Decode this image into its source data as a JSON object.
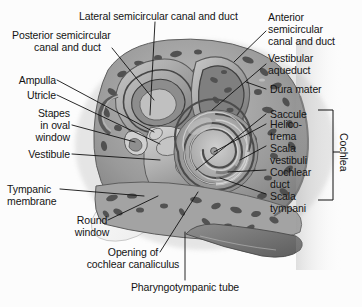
{
  "figure": {
    "style": "grayscale medical illustration",
    "background_color": "#fcfcfc",
    "text_color": "#141414",
    "leader_line_color": "#111111"
  },
  "labels": {
    "lateral_canal": "Lateral semicircular canal and duct",
    "posterior_canal_l1": "Posterior semicircular",
    "posterior_canal_l2": "canal and duct",
    "anterior_canal_l1": "Anterior",
    "anterior_canal_l2": "semicircular",
    "anterior_canal_l3": "canal and duct",
    "vestibular_aqueduct_l1": "Vestibular",
    "vestibular_aqueduct_l2": "aqueduct",
    "dura_mater": "Dura mater",
    "saccule": "Saccule",
    "ampulla": "Ampulla",
    "utricle": "Utricle",
    "stapes_l1": "Stapes",
    "stapes_l2": "in oval",
    "stapes_l3": "window",
    "vestibule": "Vestibule",
    "tympanic_membrane_l1": "Tympanic",
    "tympanic_membrane_l2": "membrane",
    "round_window_l1": "Round",
    "round_window_l2": "window",
    "opening_canaliculus_l1": "Opening of",
    "opening_canaliculus_l2": "cochlear canaliculus",
    "pharyngotympanic_tube": "Pharyngotympanic tube",
    "helicotrema_l1": "Helico-",
    "helicotrema_l2": "trema",
    "scala_vestibuli_l1": "Scala",
    "scala_vestibuli_l2": "vestibuli",
    "cochlear_duct_l1": "Cochlear",
    "cochlear_duct_l2": "duct",
    "scala_tympani_l1": "Scala",
    "scala_tympani_l2": "tympani",
    "cochlea_bracket": "Cochlea"
  }
}
